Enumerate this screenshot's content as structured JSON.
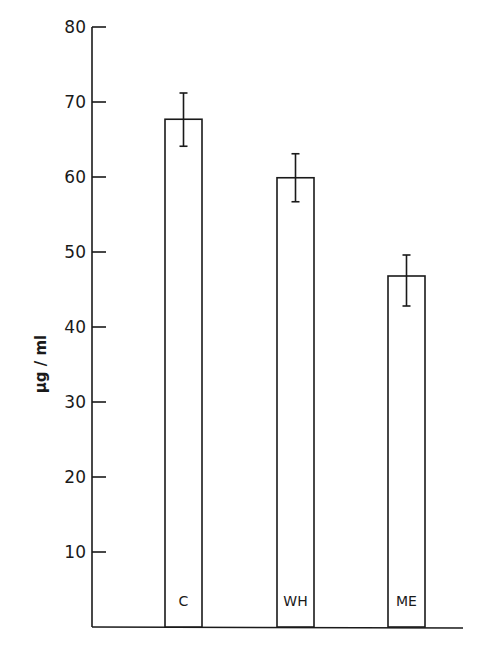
{
  "chart_data": {
    "type": "bar",
    "title": "",
    "xlabel": "",
    "ylabel": "µg / ml",
    "ylim": [
      0,
      80
    ],
    "yticks": [
      10,
      20,
      30,
      40,
      50,
      60,
      70,
      80
    ],
    "grid": false,
    "legend": null,
    "categories": [
      "C",
      "WH",
      "ME"
    ],
    "values": [
      67.7,
      59.9,
      46.8
    ],
    "error_bars": [
      {
        "category": "C",
        "upper": 71.2,
        "lower": 64.1
      },
      {
        "category": "WH",
        "upper": 63.1,
        "lower": 56.7
      },
      {
        "category": "ME",
        "upper": 49.6,
        "lower": 42.8
      }
    ],
    "bar_label_position": "inside-bottom",
    "colors": {
      "bar_fill": "#ffffff",
      "stroke": "#1a1a1a",
      "background": "#ffffff"
    }
  }
}
